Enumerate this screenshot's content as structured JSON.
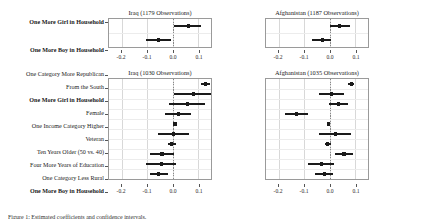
{
  "figure": {
    "caption": "Figure 1: Estimated coefficients and confidence intervals."
  },
  "axis": {
    "xmin": -0.25,
    "xmax": 0.15,
    "ticks": [
      -0.2,
      -0.1,
      0.0,
      0.1
    ],
    "tick_labels": [
      "-0.2",
      "-0.1",
      "0.0",
      "0.1"
    ],
    "zero": 0.0
  },
  "chart_data": {
    "type": "scatter",
    "title": "",
    "xlabel": "",
    "ylabel": "",
    "xlim": [
      -0.25,
      0.15
    ],
    "grid": true,
    "legend": "none",
    "panels": [
      {
        "id": "top-left",
        "title": "Iraq (1179 Observations)",
        "country": "Iraq",
        "observations": 1179,
        "rows": [
          {
            "label": "One More Girl in Household",
            "bold": true,
            "estimate": 0.061,
            "low": 0.004,
            "high": 0.11
          },
          {
            "label": "One More Boy in Household",
            "bold": true,
            "estimate": -0.056,
            "low": -0.104,
            "high": -0.007
          }
        ]
      },
      {
        "id": "top-right",
        "title": "Afghanistan (1187 Observations)",
        "country": "Afghanistan",
        "observations": 1187,
        "rows": [
          {
            "label": "One More Girl in Household",
            "bold": true,
            "estimate": 0.037,
            "low": 0.0,
            "high": 0.078
          },
          {
            "label": "One More Boy in Household",
            "bold": true,
            "estimate": -0.03,
            "low": -0.07,
            "high": 0.006
          }
        ]
      },
      {
        "id": "bottom-left",
        "title": "Iraq (1030 Observations)",
        "country": "Iraq",
        "observations": 1030,
        "rows": [
          {
            "label": "One Category More Republican",
            "bold": false,
            "estimate": 0.128,
            "low": 0.112,
            "high": 0.145
          },
          {
            "label": "From the South",
            "bold": false,
            "estimate": 0.08,
            "low": 0.004,
            "high": 0.15
          },
          {
            "label": "One More Girl in Household",
            "bold": true,
            "estimate": 0.058,
            "low": -0.013,
            "high": 0.127
          },
          {
            "label": "Female",
            "bold": false,
            "estimate": 0.022,
            "low": -0.03,
            "high": 0.072
          },
          {
            "label": "One Income Category Higher",
            "bold": false,
            "estimate": 0.009,
            "low": 0.002,
            "high": 0.016
          },
          {
            "label": "Veteran",
            "bold": false,
            "estimate": 0.002,
            "low": -0.056,
            "high": 0.062
          },
          {
            "label": "Ten Years Older (50 vs. 40)",
            "bold": false,
            "estimate": -0.004,
            "low": -0.02,
            "high": 0.013
          },
          {
            "label": "Four More Years of Education",
            "bold": false,
            "estimate": -0.042,
            "low": -0.088,
            "high": 0.004
          },
          {
            "label": "One Category Less Rural",
            "bold": false,
            "estimate": -0.045,
            "low": -0.104,
            "high": 0.012
          },
          {
            "label": "One More Boy in Household",
            "bold": true,
            "estimate": -0.055,
            "low": -0.089,
            "high": -0.02
          }
        ]
      },
      {
        "id": "bottom-right",
        "title": "Afghanistan (1035 Observations)",
        "country": "Afghanistan",
        "observations": 1035,
        "rows": [
          {
            "label": "One Category More Republican",
            "bold": false,
            "estimate": 0.084,
            "low": 0.072,
            "high": 0.097
          },
          {
            "label": "From the South",
            "bold": false,
            "estimate": 0.006,
            "low": -0.043,
            "high": 0.056
          },
          {
            "label": "One More Girl in Household",
            "bold": true,
            "estimate": 0.035,
            "low": -0.002,
            "high": 0.073
          },
          {
            "label": "Female",
            "bold": false,
            "estimate": -0.13,
            "low": -0.175,
            "high": -0.085
          },
          {
            "label": "One Income Category Higher",
            "bold": false,
            "estimate": -0.005,
            "low": -0.01,
            "high": 0.001
          },
          {
            "label": "Veteran",
            "bold": false,
            "estimate": 0.022,
            "low": -0.042,
            "high": 0.085
          },
          {
            "label": "Ten Years Older (50 vs. 40)",
            "bold": false,
            "estimate": -0.008,
            "low": -0.02,
            "high": 0.005
          },
          {
            "label": "Four More Years of Education",
            "bold": false,
            "estimate": 0.056,
            "low": 0.019,
            "high": 0.092
          },
          {
            "label": "One Category Less Rural",
            "bold": false,
            "estimate": -0.031,
            "low": -0.085,
            "high": 0.018
          },
          {
            "label": "One More Boy in Household",
            "bold": true,
            "estimate": -0.02,
            "low": -0.057,
            "high": 0.012
          }
        ]
      }
    ]
  }
}
